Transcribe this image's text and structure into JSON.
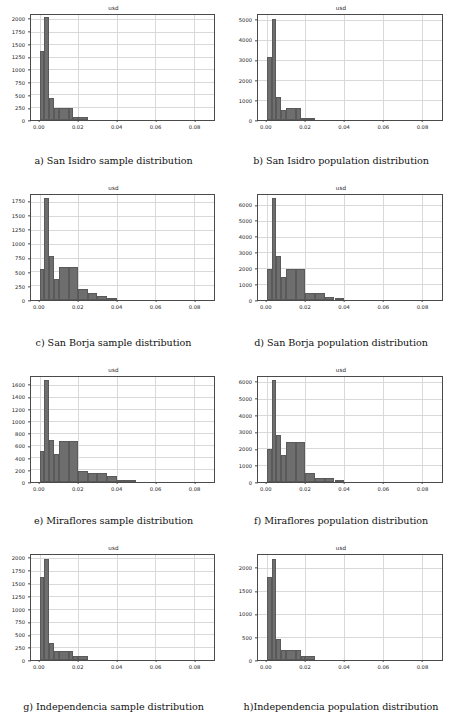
{
  "figure": {
    "panel_title": "usd",
    "xlabel": "",
    "ylabel": "",
    "bar_color": "#6e6e6e",
    "grid_color": "#d9d9d9",
    "axis_color": "#4a4a4a"
  },
  "chart_data": [
    {
      "id": "a",
      "type": "bar",
      "title": "usd",
      "caption": "a) San Isidro sample distribution",
      "xlabel": "",
      "ylabel": "",
      "xlim": [
        -0.0045,
        0.0905
      ],
      "ylim": [
        0,
        2100
      ],
      "grid": true,
      "legend": null,
      "xticks": [
        0.0,
        0.02,
        0.04,
        0.06,
        0.08
      ],
      "xtick_labels": [
        "0.00",
        "0.02",
        "0.04",
        "0.06",
        "0.08"
      ],
      "yticks": [
        0,
        250,
        500,
        750,
        1000,
        1250,
        1500,
        1750,
        2000
      ],
      "ytick_labels": [
        "0",
        "250",
        "500",
        "750",
        "1000",
        "1250",
        "1500",
        "1750",
        "2000"
      ],
      "bin_edges": [
        0.0,
        0.0025,
        0.005,
        0.0075,
        0.01,
        0.015,
        0.0175,
        0.02,
        0.025
      ],
      "values": [
        1390,
        2060,
        450,
        250,
        250,
        250,
        70,
        70
      ]
    },
    {
      "id": "b",
      "type": "bar",
      "title": "usd",
      "caption": "b) San Isidro population distribution",
      "xlabel": "",
      "ylabel": "",
      "xlim": [
        -0.0045,
        0.0905
      ],
      "ylim": [
        0,
        5300
      ],
      "grid": true,
      "legend": null,
      "xticks": [
        0.0,
        0.02,
        0.04,
        0.06,
        0.08
      ],
      "xtick_labels": [
        "0.00",
        "0.02",
        "0.04",
        "0.06",
        "0.08"
      ],
      "yticks": [
        0,
        1000,
        2000,
        3000,
        4000,
        5000
      ],
      "ytick_labels": [
        "0",
        "1000",
        "2000",
        "3000",
        "4000",
        "5000"
      ],
      "bin_edges": [
        0.0,
        0.0025,
        0.005,
        0.0075,
        0.01,
        0.015,
        0.0175,
        0.02,
        0.025
      ],
      "values": [
        3200,
        5100,
        1150,
        500,
        620,
        620,
        110,
        110
      ]
    },
    {
      "id": "c",
      "type": "bar",
      "title": "usd",
      "caption": "c) San Borja sample distribution",
      "xlabel": "",
      "ylabel": "",
      "xlim": [
        -0.0045,
        0.0905
      ],
      "ylim": [
        0,
        1880
      ],
      "grid": true,
      "legend": null,
      "xticks": [
        0.0,
        0.02,
        0.04,
        0.06,
        0.08
      ],
      "xtick_labels": [
        "0.00",
        "0.02",
        "0.04",
        "0.06",
        "0.08"
      ],
      "yticks": [
        0,
        250,
        500,
        750,
        1000,
        1250,
        1500,
        1750
      ],
      "ytick_labels": [
        "0",
        "250",
        "500",
        "750",
        "1000",
        "1250",
        "1500",
        "1750"
      ],
      "bin_edges": [
        0.0,
        0.0025,
        0.005,
        0.0075,
        0.01,
        0.015,
        0.02,
        0.025,
        0.03,
        0.035,
        0.04
      ],
      "values": [
        560,
        1830,
        780,
        380,
        590,
        590,
        200,
        120,
        75,
        20
      ]
    },
    {
      "id": "d",
      "type": "bar",
      "title": "usd",
      "caption": "d) San Borja population distribution",
      "xlabel": "",
      "ylabel": "",
      "xlim": [
        -0.0045,
        0.0905
      ],
      "ylim": [
        0,
        6700
      ],
      "grid": true,
      "legend": null,
      "xticks": [
        0.0,
        0.02,
        0.04,
        0.06,
        0.08
      ],
      "xtick_labels": [
        "0.00",
        "0.02",
        "0.04",
        "0.06",
        "0.08"
      ],
      "yticks": [
        0,
        1000,
        2000,
        3000,
        4000,
        5000,
        6000
      ],
      "ytick_labels": [
        "0",
        "1000",
        "2000",
        "3000",
        "4000",
        "5000",
        "6000"
      ],
      "bin_edges": [
        0.0,
        0.0025,
        0.005,
        0.0075,
        0.01,
        0.015,
        0.02,
        0.025,
        0.03,
        0.035,
        0.04
      ],
      "values": [
        2000,
        6500,
        2800,
        1500,
        2000,
        2000,
        470,
        470,
        180,
        60
      ]
    },
    {
      "id": "e",
      "type": "bar",
      "title": "usd",
      "caption": "e) Miraflores sample distribution",
      "xlabel": "",
      "ylabel": "",
      "xlim": [
        -0.0045,
        0.0905
      ],
      "ylim": [
        0,
        1750
      ],
      "grid": true,
      "legend": null,
      "xticks": [
        0.0,
        0.02,
        0.04,
        0.06,
        0.08
      ],
      "xtick_labels": [
        "0.00",
        "0.02",
        "0.04",
        "0.06",
        "0.08"
      ],
      "yticks": [
        0,
        200,
        400,
        600,
        800,
        1000,
        1200,
        1400,
        1600
      ],
      "ytick_labels": [
        "0",
        "200",
        "400",
        "600",
        "800",
        "1000",
        "1200",
        "1400",
        "1600"
      ],
      "bin_edges": [
        0.0,
        0.0025,
        0.005,
        0.0075,
        0.01,
        0.015,
        0.02,
        0.025,
        0.03,
        0.035,
        0.04,
        0.05
      ],
      "values": [
        520,
        1700,
        700,
        460,
        690,
        690,
        180,
        150,
        150,
        100,
        25
      ]
    },
    {
      "id": "f",
      "type": "bar",
      "title": "usd",
      "caption": "f) Miraflores population distribution",
      "xlabel": "",
      "ylabel": "",
      "xlim": [
        -0.0045,
        0.0905
      ],
      "ylim": [
        0,
        6350
      ],
      "grid": true,
      "legend": null,
      "xticks": [
        0.0,
        0.02,
        0.04,
        0.06,
        0.08
      ],
      "xtick_labels": [
        "0.00",
        "0.02",
        "0.04",
        "0.06",
        "0.08"
      ],
      "yticks": [
        0,
        1000,
        2000,
        3000,
        4000,
        5000,
        6000
      ],
      "ytick_labels": [
        "0",
        "1000",
        "2000",
        "3000",
        "4000",
        "5000",
        "6000"
      ],
      "bin_edges": [
        0.0,
        0.0025,
        0.005,
        0.0075,
        0.01,
        0.015,
        0.02,
        0.025,
        0.03,
        0.035,
        0.04
      ],
      "values": [
        2000,
        6150,
        2850,
        1620,
        2400,
        2400,
        560,
        250,
        250,
        80
      ]
    },
    {
      "id": "g",
      "type": "bar",
      "title": "usd",
      "caption": "g) Independencia sample distribution",
      "xlabel": "",
      "ylabel": "",
      "xlim": [
        -0.0045,
        0.0905
      ],
      "ylim": [
        0,
        2080
      ],
      "grid": true,
      "legend": null,
      "xticks": [
        0.0,
        0.02,
        0.04,
        0.06,
        0.08
      ],
      "xtick_labels": [
        "0.00",
        "0.02",
        "0.04",
        "0.06",
        "0.08"
      ],
      "yticks": [
        0,
        250,
        500,
        750,
        1000,
        1250,
        1500,
        1750,
        2000
      ],
      "ytick_labels": [
        "0",
        "250",
        "500",
        "750",
        "1000",
        "1250",
        "1500",
        "1750",
        "2000"
      ],
      "bin_edges": [
        0.0,
        0.0025,
        0.005,
        0.0075,
        0.01,
        0.015,
        0.0175,
        0.02,
        0.025
      ],
      "values": [
        1640,
        2000,
        340,
        180,
        180,
        180,
        75,
        75
      ]
    },
    {
      "id": "h",
      "type": "bar",
      "title": "usd",
      "caption": "h)Independencia population distribution",
      "xlabel": "",
      "ylabel": "",
      "xlim": [
        -0.0045,
        0.0905
      ],
      "ylim": [
        0,
        2300
      ],
      "grid": true,
      "legend": null,
      "xticks": [
        0.0,
        0.02,
        0.04,
        0.06,
        0.08
      ],
      "xtick_labels": [
        "0.00",
        "0.02",
        "0.04",
        "0.06",
        "0.08"
      ],
      "yticks": [
        0,
        500,
        1000,
        1500,
        2000
      ],
      "ytick_labels": [
        "0",
        "500",
        "1000",
        "1500",
        "2000"
      ],
      "bin_edges": [
        0.0,
        0.0025,
        0.005,
        0.0075,
        0.01,
        0.015,
        0.0175,
        0.02,
        0.025
      ],
      "values": [
        1820,
        2220,
        470,
        230,
        230,
        230,
        90,
        90
      ]
    }
  ]
}
